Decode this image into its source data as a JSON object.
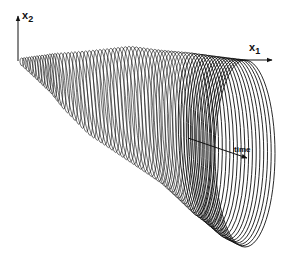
{
  "diagram": {
    "type": "3d-tube-of-ellipses",
    "axes": {
      "x2": {
        "label": "x",
        "subscript": "2",
        "direction": "up"
      },
      "x1": {
        "label": "x",
        "subscript": "1",
        "direction": "right"
      },
      "time": {
        "label": "time",
        "direction": "diagonal-down-right"
      }
    },
    "colors": {
      "stroke": "#111111",
      "background": "#ffffff"
    },
    "ellipse_count": 70
  }
}
